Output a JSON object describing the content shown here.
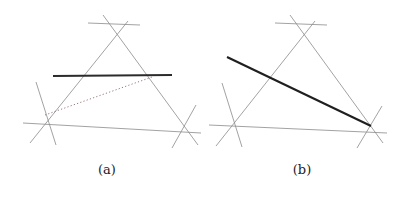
{
  "figure": {
    "width": 406,
    "height": 197,
    "background_color": "#ffffff",
    "panels": [
      {
        "id": "a",
        "caption": "(a)",
        "caption_position": {
          "x": 107,
          "y": 170
        },
        "description": "Triangle formed by three extended straight lines with a bold horizontal chord and a dotted chord",
        "vertices": {
          "top": {
            "x": 115,
            "y": 28
          },
          "left": {
            "x": 45,
            "y": 115
          },
          "right": {
            "x": 185,
            "y": 127
          }
        },
        "lines": [
          {
            "name": "side-top-left-extended",
            "style": "thin",
            "color": "#8a8a8a",
            "x1": 30,
            "y1": 143,
            "x2": 128,
            "y2": 21
          },
          {
            "name": "side-top-right-extended",
            "style": "thin",
            "color": "#8a8a8a",
            "x1": 103,
            "y1": 15,
            "x2": 198,
            "y2": 145
          },
          {
            "name": "side-left-right-extended",
            "style": "thin",
            "color": "#8a8a8a",
            "x1": 23,
            "y1": 123,
            "x2": 201,
            "y2": 133
          },
          {
            "name": "cross-top-horizontal",
            "style": "thin",
            "color": "#8a8a8a",
            "x1": 88,
            "y1": 23,
            "x2": 140,
            "y2": 25
          },
          {
            "name": "cross-left-steep",
            "style": "thin",
            "color": "#8a8a8a",
            "x1": 36,
            "y1": 82,
            "x2": 56,
            "y2": 145
          },
          {
            "name": "cross-right-steep",
            "style": "thin",
            "color": "#8a8a8a",
            "x1": 196,
            "y1": 105,
            "x2": 172,
            "y2": 148
          },
          {
            "name": "bold-horizontal-chord",
            "style": "bold",
            "color": "#2b2b2b",
            "x1": 53,
            "y1": 76,
            "x2": 172,
            "y2": 75
          },
          {
            "name": "dotted-chord",
            "style": "dotted",
            "color": "#8a6a6a",
            "x1": 45,
            "y1": 115,
            "x2": 152,
            "y2": 77
          }
        ]
      },
      {
        "id": "b",
        "caption": "(b)",
        "caption_position": {
          "x": 302,
          "y": 170
        },
        "description": "Triangle formed by three extended straight lines with a single bold diagonal chord",
        "vertices": {
          "top": {
            "x": 302,
            "y": 28
          },
          "left": {
            "x": 231,
            "y": 117
          },
          "right": {
            "x": 370,
            "y": 125
          }
        },
        "lines": [
          {
            "name": "side-top-left-extended",
            "style": "thin",
            "color": "#8a8a8a",
            "x1": 216,
            "y1": 146,
            "x2": 315,
            "y2": 21
          },
          {
            "name": "side-top-right-extended",
            "style": "thin",
            "color": "#8a8a8a",
            "x1": 290,
            "y1": 15,
            "x2": 383,
            "y2": 143
          },
          {
            "name": "side-left-right-extended",
            "style": "thin",
            "color": "#8a8a8a",
            "x1": 209,
            "y1": 125,
            "x2": 387,
            "y2": 133
          },
          {
            "name": "cross-top-horizontal",
            "style": "thin",
            "color": "#8a8a8a",
            "x1": 275,
            "y1": 23,
            "x2": 327,
            "y2": 25
          },
          {
            "name": "cross-left-steep",
            "style": "thin",
            "color": "#8a8a8a",
            "x1": 222,
            "y1": 83,
            "x2": 242,
            "y2": 147
          },
          {
            "name": "cross-right-steep",
            "style": "thin",
            "color": "#8a8a8a",
            "x1": 382,
            "y1": 106,
            "x2": 357,
            "y2": 148
          },
          {
            "name": "bold-diagonal-chord",
            "style": "bold",
            "color": "#1f1f1f",
            "x1": 227,
            "y1": 57,
            "x2": 371,
            "y2": 126
          }
        ]
      }
    ],
    "stroke_widths": {
      "thin": 0.8,
      "bold": 2.1,
      "dotted": 0.9
    },
    "dot_pattern": "1.2 2.2"
  }
}
